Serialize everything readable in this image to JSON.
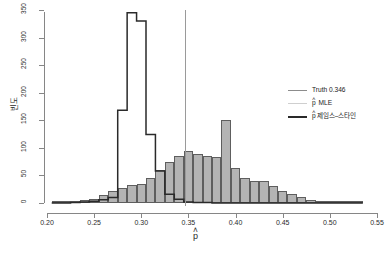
{
  "chart_data": {
    "type": "bar",
    "title": "",
    "xlabel": "p̂",
    "ylabel": "빈도",
    "xlim": [
      0.2,
      0.55
    ],
    "ylim": [
      0,
      350
    ],
    "grid": false,
    "x_ticks": [
      "0.20",
      "0.25",
      "0.30",
      "0.35",
      "0.40",
      "0.45",
      "0.50",
      "0.55"
    ],
    "x_tick_values": [
      0.2,
      0.25,
      0.3,
      0.35,
      0.4,
      0.45,
      0.5,
      0.55
    ],
    "y_ticks": [
      "0",
      "50",
      "100",
      "150",
      "200",
      "250",
      "300",
      "350"
    ],
    "y_tick_values": [
      0,
      50,
      100,
      150,
      200,
      250,
      300,
      350
    ],
    "bin_width": 0.01,
    "legend_position": "right",
    "annotations": [
      {
        "name": "truth-line",
        "type": "vline",
        "x": 0.346,
        "label": "Truth 0.346",
        "color": "#9a9a9a"
      }
    ],
    "series": [
      {
        "name": "p̂ MLE",
        "style": "filled-bars",
        "fill": "#b4b4b4",
        "stroke": "#5e5e5e",
        "bin_starts": [
          0.205,
          0.215,
          0.225,
          0.235,
          0.245,
          0.255,
          0.265,
          0.275,
          0.285,
          0.295,
          0.305,
          0.315,
          0.325,
          0.335,
          0.345,
          0.355,
          0.365,
          0.375,
          0.385,
          0.395,
          0.405,
          0.415,
          0.425,
          0.435,
          0.445,
          0.455,
          0.465,
          0.475,
          0.485,
          0.495,
          0.505,
          0.515,
          0.525
        ],
        "values": [
          1,
          2,
          3,
          5,
          8,
          14,
          22,
          27,
          33,
          34,
          46,
          59,
          75,
          86,
          94,
          88,
          86,
          84,
          150,
          63,
          45,
          40,
          40,
          30,
          22,
          16,
          11,
          6,
          3,
          2,
          1,
          1,
          1
        ]
      },
      {
        "name": "p̂ 제임스–스타인",
        "style": "step-outline",
        "stroke": "#2a2a2a",
        "bin_starts": [
          0.205,
          0.215,
          0.225,
          0.235,
          0.245,
          0.255,
          0.265,
          0.275,
          0.285,
          0.295,
          0.305,
          0.315,
          0.325,
          0.335,
          0.345,
          0.355,
          0.365,
          0.375,
          0.385,
          0.395,
          0.405,
          0.415,
          0.425,
          0.435,
          0.445,
          0.455,
          0.465,
          0.475,
          0.485,
          0.495,
          0.505,
          0.515,
          0.525
        ],
        "values": [
          0,
          0,
          1,
          2,
          3,
          6,
          10,
          168,
          345,
          330,
          124,
          58,
          16,
          7,
          2,
          1,
          1,
          0,
          0,
          0,
          0,
          0,
          0,
          0,
          0,
          0,
          0,
          0,
          0,
          0,
          0,
          0,
          0
        ]
      }
    ]
  },
  "legend": {
    "items": [
      {
        "key": "truth",
        "label": "Truth 0.346",
        "hat": false,
        "color": "#8c8c8c"
      },
      {
        "key": "mle",
        "label": "MLE",
        "hat": true,
        "color": "#cfcfcf"
      },
      {
        "key": "js",
        "label": "제임스–스타인",
        "hat": true,
        "color": "#2a2a2a"
      }
    ]
  },
  "axis": {
    "x_title_base": "p",
    "x_title_hat": "˄",
    "y_title": "빈도"
  }
}
